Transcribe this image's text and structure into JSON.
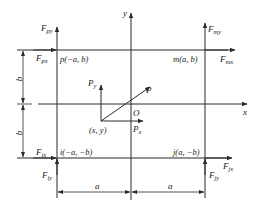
{
  "diagram": {
    "type": "force-coordinate-diagram",
    "colors": {
      "line": "#2a2a2a",
      "text": "#222222",
      "background": "#ffffff"
    },
    "axes": {
      "x_label": "x",
      "y_label": "y",
      "origin_label": "O"
    },
    "corners": {
      "p": {
        "label": "p(−a, b)",
        "fx": "F",
        "fx_sub": "px",
        "fy": "F",
        "fy_sub": "py"
      },
      "m": {
        "label": "m(a, b)",
        "fx": "F",
        "fx_sub": "mx",
        "fy": "F",
        "fy_sub": "my"
      },
      "i": {
        "label": "i(−a, −b)",
        "fx": "F",
        "fx_sub": "ix",
        "fy": "F",
        "fy_sub": "iy"
      },
      "j": {
        "label": "j(a, −b)",
        "fx": "F",
        "fx_sub": "jx",
        "fy": "F",
        "fy_sub": "jy"
      }
    },
    "load": {
      "point_label": "(x, y)",
      "force_label": "P",
      "px_label": "P",
      "px_sub": "x",
      "py_label": "P",
      "py_sub": "y"
    },
    "dimensions": {
      "half_width": "a",
      "half_height": "b"
    }
  }
}
